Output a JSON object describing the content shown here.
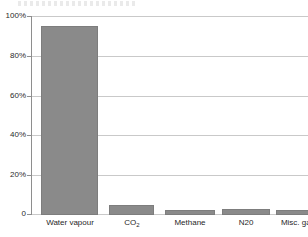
{
  "chart_data": {
    "type": "bar",
    "title": "",
    "subtitle": "",
    "xlabel": "",
    "ylabel": "",
    "categories": [
      "Water vapour",
      "CO₂",
      "Methane",
      "N20",
      "Misc. gases"
    ],
    "category_labels_html": [
      "Water vapour",
      "CO2",
      "Methane",
      "N20",
      "Misc. gases"
    ],
    "values": [
      95,
      5,
      2.5,
      3,
      2.5
    ],
    "series": [
      {
        "name": "Share of greenhouse gases",
        "values": [
          95,
          5,
          2.5,
          3,
          2.5
        ]
      }
    ],
    "ylim": [
      0,
      100
    ],
    "yticks": [
      0,
      20,
      40,
      60,
      80,
      100
    ],
    "ytick_labels": [
      "0",
      "20%",
      "40%",
      "60%",
      "80%",
      "100%"
    ],
    "grid": true,
    "grid_axis": "y",
    "legend": false,
    "legend_position": "none",
    "bar_color": "#8a8a8a",
    "bar_border_color": "#7d7d7d",
    "gridline_color": "#c9c9c9",
    "axis_color": "#8e8e8e",
    "background_color": "#ffffff"
  },
  "axes": {
    "y_tick_0": "0",
    "y_tick_1": "20%",
    "y_tick_2": "40%",
    "y_tick_3": "60%",
    "y_tick_4": "80%",
    "y_tick_5": "100%"
  },
  "x_axis": {
    "cat_0": "Water vapour",
    "cat_1_base": "CO",
    "cat_1_sub": "2",
    "cat_2": "Methane",
    "cat_3": "N20",
    "cat_4": "Misc. gases"
  }
}
